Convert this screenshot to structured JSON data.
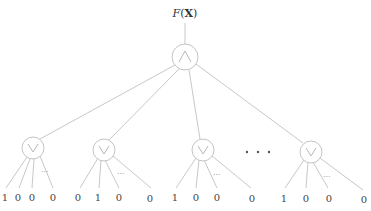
{
  "diagram": {
    "title": "F(X)",
    "title_parts": {
      "f": "F",
      "open": "(",
      "x": "X",
      "close": ")"
    },
    "root": {
      "operator": "and",
      "symbol": "∧"
    },
    "groups": [
      {
        "operator": "or",
        "symbol": "∨",
        "leaves": [
          "1",
          "0",
          "0",
          "0"
        ],
        "ellipsis": "···"
      },
      {
        "operator": "or",
        "symbol": "∨",
        "leaves": [
          "0",
          "1",
          "0",
          "0"
        ],
        "ellipsis": "···"
      },
      {
        "operator": "or",
        "symbol": "∨",
        "leaves": [
          "1",
          "0",
          "0",
          "0"
        ],
        "ellipsis": "···"
      },
      {
        "operator": "or",
        "symbol": "∨",
        "leaves": [
          "1",
          "0",
          "0",
          "0"
        ],
        "ellipsis": "···"
      }
    ],
    "between_groups_ellipsis": "• • •",
    "colors": {
      "line": "#c8c8c8",
      "text": "#444444"
    }
  }
}
